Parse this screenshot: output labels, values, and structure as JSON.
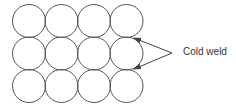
{
  "diagram": {
    "grid": {
      "rows": 3,
      "cols": 4,
      "radius": 16.5,
      "pitch": 32.5,
      "origin_x": 29,
      "origin_y": 21,
      "stroke": "#555555"
    },
    "annotation": {
      "label": "Cold weld",
      "color": "#333333"
    },
    "arrows": [
      {
        "from": [
          172,
          53
        ],
        "to": [
          134,
          38
        ]
      },
      {
        "from": [
          172,
          53
        ],
        "to": [
          134,
          69
        ]
      }
    ]
  }
}
